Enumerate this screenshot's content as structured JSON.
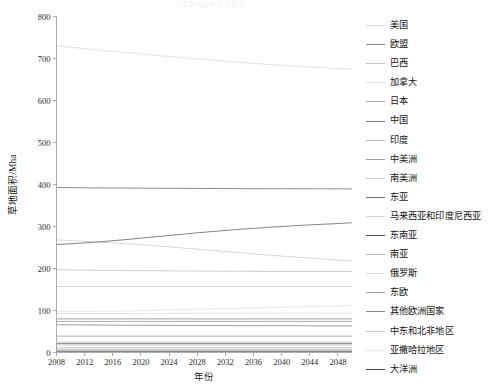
{
  "figure": {
    "top_faint_text": "——— 全球草地面积变化预测",
    "background_color": "#ffffff"
  },
  "chart_data": {
    "type": "line",
    "title": "",
    "xlabel": "年份",
    "ylabel": "草地面积/Mha",
    "xlim": [
      2008,
      2050
    ],
    "ylim": [
      0,
      800
    ],
    "xticks": [
      2008,
      2012,
      2016,
      2020,
      2024,
      2028,
      2032,
      2036,
      2040,
      2044,
      2048
    ],
    "yticks": [
      0,
      100,
      200,
      300,
      400,
      500,
      600,
      700,
      800
    ],
    "grid": false,
    "legend_position": "right",
    "x": [
      2008,
      2013,
      2018,
      2023,
      2028,
      2033,
      2038,
      2043,
      2048,
      2050
    ],
    "series": [
      {
        "name": "美国",
        "color": "#d9d9d9",
        "values": [
          730,
          722,
          714,
          706,
          699,
          692,
          686,
          681,
          676,
          674
        ]
      },
      {
        "name": "欧盟",
        "color": "#8c8c8c",
        "values": [
          66,
          65.5,
          65,
          64.6,
          64.3,
          64,
          63.8,
          63.6,
          63.4,
          63.3
        ]
      },
      {
        "name": "巴西",
        "color": "#c2c2c2",
        "values": [
          197,
          196,
          195,
          194.5,
          194,
          193.6,
          193.2,
          193,
          192.8,
          192.7
        ]
      },
      {
        "name": "加拿大",
        "color": "#e0e0e0",
        "values": [
          27,
          27,
          27,
          27,
          27,
          27,
          27,
          27,
          27,
          27
        ]
      },
      {
        "name": "日本",
        "color": "#a8a8a8",
        "values": [
          6,
          6,
          6,
          6,
          6,
          6,
          6,
          6,
          6,
          6
        ]
      },
      {
        "name": "中国",
        "color": "#7a7a7a",
        "values": [
          393,
          392,
          391.5,
          391,
          390.6,
          390.2,
          390,
          389.8,
          389.6,
          389.5
        ]
      },
      {
        "name": "印度",
        "color": "#bfbfbf",
        "values": [
          11,
          11,
          11,
          11,
          11,
          11,
          11,
          11,
          11,
          11
        ]
      },
      {
        "name": "中美洲",
        "color": "#9e9e9e",
        "values": [
          39,
          39,
          39,
          39,
          39,
          39,
          39,
          39,
          39,
          39
        ]
      },
      {
        "name": "南美洲",
        "color": "#cfcfcf",
        "values": [
          268,
          264,
          259,
          253,
          246,
          239,
          232,
          226,
          220,
          218
        ]
      },
      {
        "name": "东亚",
        "color": "#6e6e6e",
        "values": [
          257,
          262,
          269,
          277,
          285,
          292,
          298,
          303,
          307,
          309
        ]
      },
      {
        "name": "马来西亚和印度尼西亚",
        "color": "#d4d4d4",
        "values": [
          11,
          11,
          11,
          11,
          11,
          11,
          11,
          11,
          11,
          11
        ]
      },
      {
        "name": "东南亚",
        "color": "#555555",
        "values": [
          22,
          22,
          22,
          22,
          22,
          22,
          22,
          22,
          22,
          22
        ]
      },
      {
        "name": "南亚",
        "color": "#b5b5b5",
        "values": [
          18,
          18,
          18,
          18,
          18,
          18,
          18,
          18,
          18,
          18
        ]
      },
      {
        "name": "俄罗斯",
        "color": "#dedede",
        "values": [
          93,
          93,
          93,
          93.2,
          93.4,
          93.6,
          93.8,
          94,
          94.2,
          94.3
        ]
      },
      {
        "name": "东欧",
        "color": "#a0a0a0",
        "values": [
          74,
          74,
          74,
          74,
          74,
          74,
          74,
          74,
          74,
          74
        ]
      },
      {
        "name": "其他欧洲国家",
        "color": "#8f8f8f",
        "values": [
          80,
          80,
          80,
          80,
          80,
          80,
          80,
          80,
          80,
          80
        ]
      },
      {
        "name": "中东和北非地区",
        "color": "#c9c9c9",
        "values": [
          157,
          157,
          157,
          157,
          157,
          157,
          157,
          157,
          157,
          157
        ]
      },
      {
        "name": "亚撒哈拉地区",
        "color": "#e6e6e6",
        "values": [
          97,
          98,
          99,
          101,
          103,
          105,
          107,
          109,
          111,
          112
        ]
      },
      {
        "name": "大洋洲",
        "color": "#4a4a4a",
        "values": [
          3,
          3,
          3,
          3,
          3,
          3,
          3,
          3,
          3,
          3
        ]
      }
    ]
  },
  "legend": {
    "items": [
      {
        "label": "美国"
      },
      {
        "label": "欧盟"
      },
      {
        "label": "巴西"
      },
      {
        "label": "加拿大"
      },
      {
        "label": "日本"
      },
      {
        "label": "中国"
      },
      {
        "label": "印度"
      },
      {
        "label": "中美洲"
      },
      {
        "label": "南美洲"
      },
      {
        "label": "东亚"
      },
      {
        "label": "马来西亚和印度尼西亚"
      },
      {
        "label": "东南亚"
      },
      {
        "label": "南亚"
      },
      {
        "label": "俄罗斯"
      },
      {
        "label": "东欧"
      },
      {
        "label": "其他欧洲国家"
      },
      {
        "label": "中东和北非地区"
      },
      {
        "label": "亚撒哈拉地区"
      },
      {
        "label": "大洋洲"
      }
    ]
  }
}
